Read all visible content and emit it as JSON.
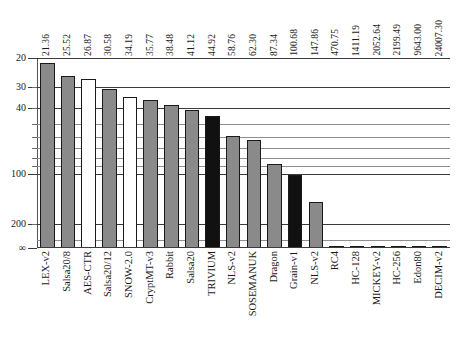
{
  "chart_data": {
    "type": "bar",
    "title": "",
    "subtitle": "",
    "xlabel": "",
    "ylabel": "",
    "orientation": "vertical",
    "yaxis": {
      "scale": "log-reversed",
      "note": "Axis is inverted: smaller values at top, larger at bottom, ending at infinity",
      "ylim": [
        20,
        "inf"
      ],
      "major_ticks": [
        "20",
        "30",
        "40",
        "100",
        "200",
        "∞"
      ],
      "tick_labels": [
        "20",
        "30",
        "40",
        "100",
        "200",
        "∞"
      ],
      "grid": true,
      "grid_note": "horizontal gridlines only, minor log gridlines between majors"
    },
    "legend": {
      "present": false,
      "position": "none"
    },
    "value_label_position": "above-plot-rotated",
    "categories": [
      "LEX-v2",
      "Salsa20/8",
      "AES-CTR",
      "Salsa20/12",
      "SNOW-2.0",
      "CryptMT-v3",
      "Rabbit",
      "Salsa20",
      "TRIVIUM",
      "NLS-v2",
      "SOSEMANUK",
      "Dragon",
      "Grain-v1",
      "NLS-v2",
      "RC4",
      "HC-128",
      "MICKEY-v2",
      "HC-256",
      "Edon80",
      "DECIM-v2"
    ],
    "values": [
      21.36,
      25.52,
      26.87,
      30.58,
      34.19,
      35.77,
      38.48,
      41.12,
      44.92,
      58.76,
      62.3,
      87.34,
      100.68,
      147.86,
      470.75,
      1411.19,
      2052.64,
      2199.49,
      9643.0,
      24007.3
    ],
    "value_labels": [
      "21.36",
      "25.52",
      "26.87",
      "30.58",
      "34.19",
      "35.77",
      "38.48",
      "41.12",
      "44.92",
      "58.76",
      "62.30",
      "87.34",
      "100.68",
      "147.86",
      "470.75",
      "1411.19",
      "2052.64",
      "2199.49",
      "9643.00",
      "24007.30"
    ],
    "bar_fills": [
      "gray",
      "gray",
      "white",
      "gray",
      "white",
      "gray",
      "gray",
      "gray",
      "black",
      "gray",
      "gray",
      "gray",
      "black",
      "gray",
      "white",
      "gray",
      "gray",
      "gray",
      "gray",
      "gray"
    ],
    "colors": {
      "gray": "#8a8a8a",
      "white": "#ffffff",
      "black": "#111111",
      "bar_outline": "#1a1a1a",
      "grid": "#8e8e8e",
      "axis": "#3b3b3b",
      "text": "#1a1a1a"
    }
  }
}
